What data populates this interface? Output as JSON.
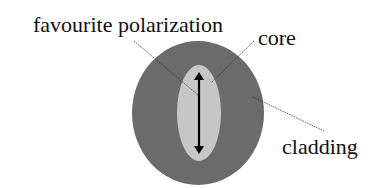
{
  "diagram": {
    "labels": {
      "polarization": "favourite polarization",
      "core": "core",
      "cladding": "cladding"
    },
    "colors": {
      "cladding": "#6b6b6b",
      "core": "#c6c6c6",
      "arrow": "#000000",
      "leader": "#333333",
      "text": "#111111"
    },
    "shapes": {
      "cladding": {
        "cx": 198,
        "cy": 113,
        "rx": 66,
        "ry": 72
      },
      "core": {
        "cx": 199,
        "cy": 113,
        "rx": 22,
        "ry": 48
      },
      "arrow": {
        "x": 199,
        "y1": 72,
        "y2": 154
      }
    }
  }
}
